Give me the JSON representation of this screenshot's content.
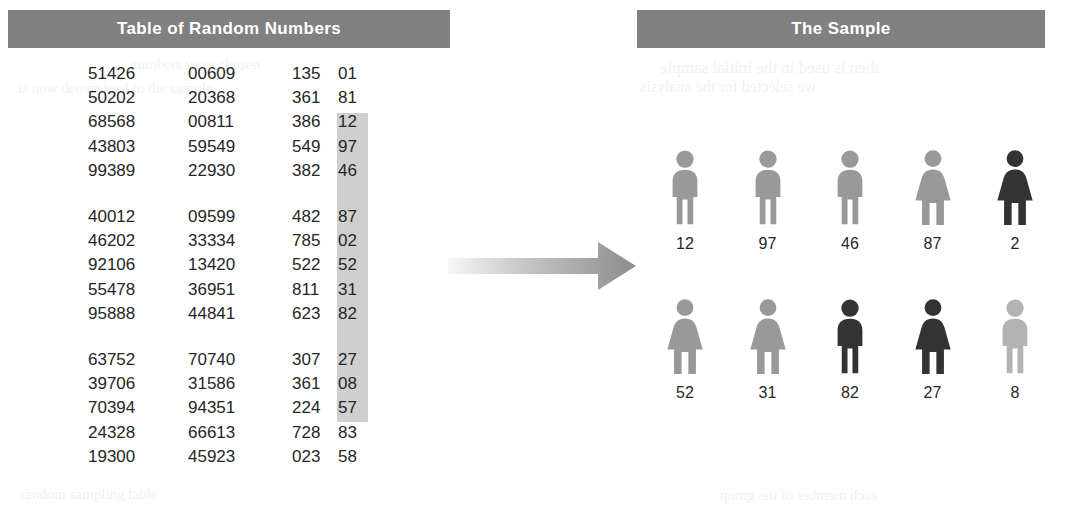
{
  "panels": {
    "left_title": "Table of Random Numbers",
    "right_title": "The Sample"
  },
  "colors": {
    "bar_gray": "#808080",
    "highlight_gray": "#cfcfcf",
    "figure_light": "#b3b3b3",
    "figure_mid": "#999999",
    "figure_dark": "#333333",
    "arrow_light": "#f2f2f2",
    "arrow_dark": "#8c8c8c",
    "text": "#262626"
  },
  "table": {
    "rows": [
      {
        "c1": "51426",
        "c2": "00609",
        "c3": "135",
        "c4": "01",
        "highlighted": false
      },
      {
        "c1": "50202",
        "c2": "20368",
        "c3": "361",
        "c4": "81",
        "highlighted": false
      },
      {
        "c1": "68568",
        "c2": "00811",
        "c3": "386",
        "c4": "12",
        "highlighted": true
      },
      {
        "c1": "43803",
        "c2": "59549",
        "c3": "549",
        "c4": "97",
        "highlighted": true
      },
      {
        "c1": "99389",
        "c2": "22930",
        "c3": "382",
        "c4": "46",
        "highlighted": true
      },
      {
        "spacer": true
      },
      {
        "c1": "40012",
        "c2": "09599",
        "c3": "482",
        "c4": "87",
        "highlighted": true
      },
      {
        "c1": "46202",
        "c2": "33334",
        "c3": "785",
        "c4": "02",
        "highlighted": true
      },
      {
        "c1": "92106",
        "c2": "13420",
        "c3": "522",
        "c4": "52",
        "highlighted": true
      },
      {
        "c1": "55478",
        "c2": "36951",
        "c3": "811",
        "c4": "31",
        "highlighted": true
      },
      {
        "c1": "95888",
        "c2": "44841",
        "c3": "623",
        "c4": "82",
        "highlighted": true
      },
      {
        "spacer": true
      },
      {
        "c1": "63752",
        "c2": "70740",
        "c3": "307",
        "c4": "27",
        "highlighted": true
      },
      {
        "c1": "39706",
        "c2": "31586",
        "c3": "361",
        "c4": "08",
        "highlighted": true
      },
      {
        "c1": "70394",
        "c2": "94351",
        "c3": "224",
        "c4": "57",
        "highlighted": false
      },
      {
        "c1": "24328",
        "c2": "66613",
        "c3": "728",
        "c4": "83",
        "highlighted": false
      },
      {
        "c1": "19300",
        "c2": "45923",
        "c3": "023",
        "c4": "58",
        "highlighted": false
      }
    ]
  },
  "sample": {
    "row1": [
      {
        "label": "12",
        "sex": "male",
        "shade": "mid"
      },
      {
        "label": "97",
        "sex": "male",
        "shade": "mid"
      },
      {
        "label": "46",
        "sex": "male",
        "shade": "mid"
      },
      {
        "label": "87",
        "sex": "female",
        "shade": "mid"
      },
      {
        "label": "2",
        "sex": "female",
        "shade": "dark"
      }
    ],
    "row2": [
      {
        "label": "52",
        "sex": "female",
        "shade": "mid"
      },
      {
        "label": "31",
        "sex": "female",
        "shade": "mid"
      },
      {
        "label": "82",
        "sex": "male",
        "shade": "dark"
      },
      {
        "label": "27",
        "sex": "female",
        "shade": "dark"
      },
      {
        "label": "8",
        "sex": "male",
        "shade": "light"
      }
    ]
  },
  "arrow": {
    "direction": "right",
    "name": "flow-arrow"
  },
  "bleed_text": {
    "a": "numbers were chosen",
    "b": "is now determined in the sample",
    "c": "then is used in the initial sample",
    "d": "we selected for the analysis",
    "e": "random sampling table",
    "f": "each member of the group"
  }
}
